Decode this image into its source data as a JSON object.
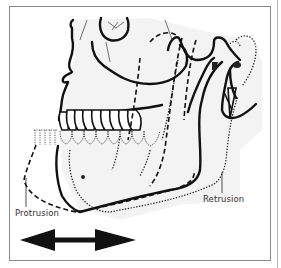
{
  "figure": {
    "labels": {
      "protrusion": "Protrusion",
      "retrusion": "Retrusion"
    },
    "legend_lines": {
      "solid": "neutral position",
      "dashed": "protrusion",
      "dotted": "retrusion"
    },
    "arrow": {
      "direction": "bidirectional-horizontal",
      "color": "#111111"
    },
    "colors": {
      "line": "#111111",
      "bone_fill": "#ededed",
      "frame": "#8a8a8a",
      "label_text": "#333333"
    }
  }
}
